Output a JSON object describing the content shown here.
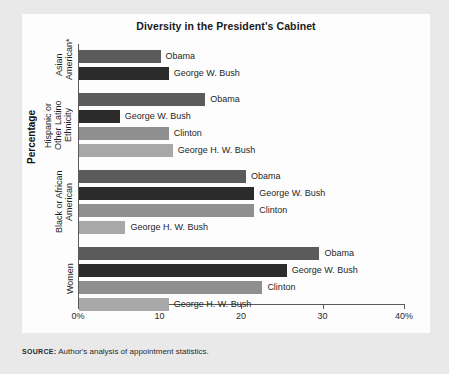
{
  "page": {
    "running_header": "",
    "background_color": "#e9e9e9",
    "card_color": "#fdfdfd"
  },
  "figure": {
    "title": "Diversity in the President's Cabinet",
    "y_axis_title": "Percentage",
    "source_kicker": "SOURCE:",
    "source_text": "Author's analysis of appointment statistics."
  },
  "chart_data": {
    "type": "bar",
    "orientation": "horizontal",
    "title": "Diversity in the President's Cabinet",
    "xlabel": "",
    "ylabel": "Percentage",
    "xlim": [
      0,
      40
    ],
    "xticks": [
      0,
      10,
      20,
      30,
      40
    ],
    "xticklabels": [
      "0%",
      "10",
      "20",
      "30",
      "40%"
    ],
    "grid": false,
    "legend": "none (bars labeled directly)",
    "series_colors": {
      "Obama": "#5b5b5b",
      "George W. Bush": "#2b2b2b",
      "Clinton": "#8f8f8f",
      "George H. W. Bush": "#a8a8a8"
    },
    "groups": [
      {
        "name": "Asian American*",
        "group_label_lines": [
          "Asian",
          "American*"
        ],
        "bars": [
          {
            "label": "Obama",
            "value": 10.0,
            "color": "#5b5b5b",
            "label_inside": false
          },
          {
            "label": "George W. Bush",
            "value": 11.0,
            "color": "#2b2b2b",
            "label_inside": false
          }
        ]
      },
      {
        "name": "Hispanic or Other Latino Ethnicity",
        "group_label_lines": [
          "Hispanic or",
          "Other Latino",
          "Ethnicity"
        ],
        "bars": [
          {
            "label": "Obama",
            "value": 15.5,
            "color": "#5b5b5b",
            "label_inside": false
          },
          {
            "label": "George W. Bush",
            "value": 5.0,
            "color": "#2b2b2b",
            "label_inside": false
          },
          {
            "label": "Clinton",
            "value": 11.0,
            "color": "#8f8f8f",
            "label_inside": false
          },
          {
            "label": "George H. W. Bush",
            "value": 11.5,
            "color": "#a8a8a8",
            "label_inside": false
          }
        ]
      },
      {
        "name": "Black or African American",
        "group_label_lines": [
          "Black or African",
          "American"
        ],
        "bars": [
          {
            "label": "Obama",
            "value": 20.5,
            "color": "#5b5b5b",
            "label_inside": false
          },
          {
            "label": "George W. Bush",
            "value": 21.5,
            "color": "#2b2b2b",
            "label_inside": false
          },
          {
            "label": "Clinton",
            "value": 21.5,
            "color": "#8f8f8f",
            "label_inside": false
          },
          {
            "label": "George H. W. Bush",
            "value": 5.7,
            "color": "#a8a8a8",
            "label_inside": false
          }
        ]
      },
      {
        "name": "Women",
        "group_label_lines": [
          "Women"
        ],
        "bars": [
          {
            "label": "Obama",
            "value": 29.5,
            "color": "#5b5b5b",
            "label_inside": false
          },
          {
            "label": "George W. Bush",
            "value": 25.5,
            "color": "#2b2b2b",
            "label_inside": false
          },
          {
            "label": "Clinton",
            "value": 22.5,
            "color": "#8f8f8f",
            "label_inside": false
          },
          {
            "label": "George H. W. Bush",
            "value": 11.0,
            "color": "#a8a8a8",
            "label_inside": false
          }
        ]
      }
    ]
  }
}
